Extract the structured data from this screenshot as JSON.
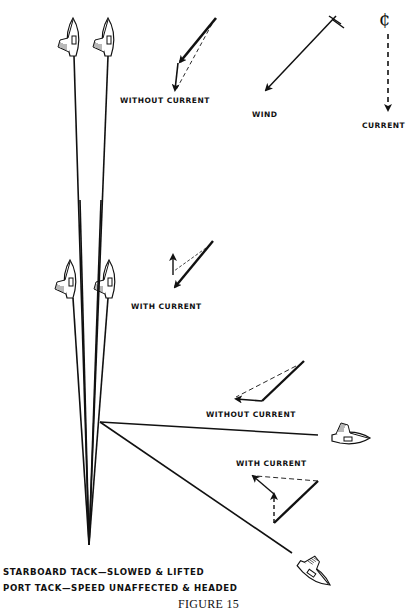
{
  "figure": {
    "title": "FIGURE 15",
    "caption_lines": [
      "STARBOARD TACK—SLOWED & LIFTED",
      "PORT TACK—SPEED UNAFFECTED & HEADED"
    ]
  },
  "legend": {
    "wind_label": "WIND",
    "current_label": "CURRENT",
    "current_symbol": "¢"
  },
  "vector_diagrams": {
    "starboard_without_current": "WITHOUT CURRENT",
    "starboard_with_current": "WITH CURRENT",
    "port_without_current": "WITHOUT CURRENT",
    "port_with_current": "WITH CURRENT"
  },
  "colors": {
    "ink": "#111111",
    "background": "#ffffff"
  }
}
